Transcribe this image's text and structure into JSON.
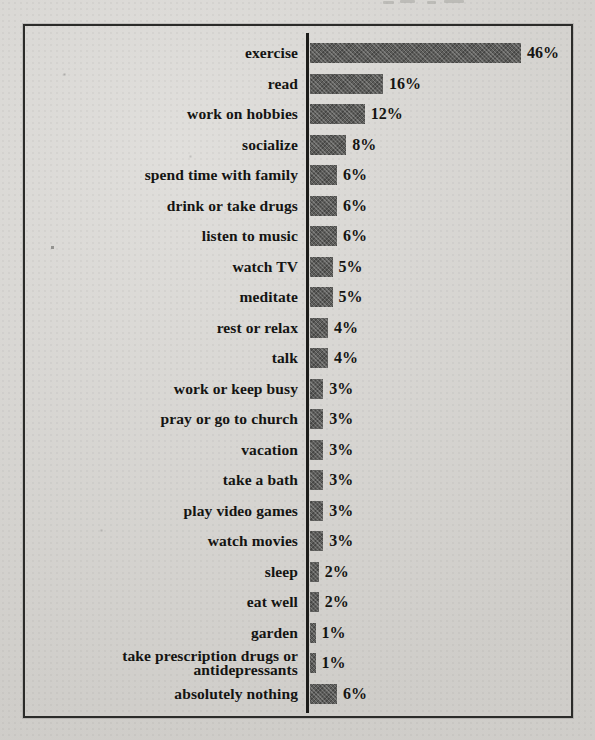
{
  "page": {
    "background_color": "#d6d4d0",
    "frame_border_color": "#2b2b29",
    "axis_color": "#1c1c1a",
    "bar_color": "#5c5c5a",
    "text_color": "#141412"
  },
  "chart_data": {
    "type": "bar",
    "orientation": "horizontal",
    "title": "",
    "xlabel": "",
    "ylabel": "",
    "xlim": [
      0,
      50
    ],
    "grid": false,
    "legend": "none",
    "unit": "%",
    "categories": [
      "exercise",
      "read",
      "work on hobbies",
      "socialize",
      "spend time with family",
      "drink or take drugs",
      "listen to music",
      "watch TV",
      "meditate",
      "rest or relax",
      "talk",
      "work or keep busy",
      "pray or go to church",
      "vacation",
      "take a bath",
      "play video games",
      "watch movies",
      "sleep",
      "eat well",
      "garden",
      "take prescription drugs or antidepressants",
      "absolutely nothing"
    ],
    "values": [
      46,
      16,
      12,
      8,
      6,
      6,
      6,
      5,
      5,
      4,
      4,
      3,
      3,
      3,
      3,
      3,
      3,
      2,
      2,
      1,
      1,
      6
    ],
    "value_labels": [
      "46%",
      "16%",
      "12%",
      "8%",
      "6%",
      "6%",
      "6%",
      "5%",
      "5%",
      "4%",
      "4%",
      "3%",
      "3%",
      "3%",
      "3%",
      "3%",
      "3%",
      "2%",
      "2%",
      "1%",
      "1%",
      "6%"
    ]
  }
}
